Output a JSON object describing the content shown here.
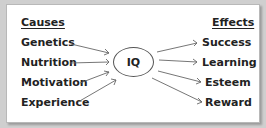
{
  "diagram": {
    "center": "IQ",
    "causes_header": "Causes",
    "effects_header": "Effects",
    "causes": [
      "Genetics",
      "Nutrition",
      "Motivation",
      "Experience"
    ],
    "effects": [
      "Success",
      "Learning",
      "Esteem",
      "Reward"
    ]
  }
}
